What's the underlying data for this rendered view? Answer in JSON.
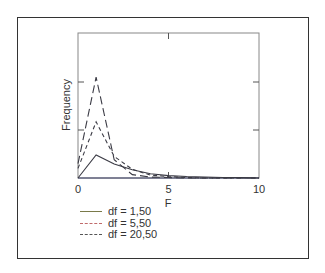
{
  "chart_data": {
    "type": "line",
    "title": "",
    "xlabel": "F",
    "ylabel": "Frequency",
    "xlim": [
      0,
      10
    ],
    "ylim": [
      0,
      3
    ],
    "xticks": [
      0,
      5,
      10
    ],
    "yticks_unlabeled": [
      1,
      2
    ],
    "grid": false,
    "legend_position": "below-left",
    "x": [
      0,
      1,
      2,
      3,
      4,
      5,
      6,
      7,
      8,
      9,
      10
    ],
    "series": [
      {
        "name": "df = 1,50",
        "style": "solid",
        "color": "#7a7a4a",
        "values": [
          0,
          0.48,
          0.29,
          0.17,
          0.09,
          0.05,
          0.03,
          0.02,
          0.01,
          0.01,
          0.0
        ]
      },
      {
        "name": "df = 5,50",
        "style": "dashed",
        "color": "#c06a6a",
        "values": [
          0.2,
          1.17,
          0.45,
          0.18,
          0.06,
          0.03,
          0.01,
          0.0,
          0.0,
          0.0,
          0.0
        ]
      },
      {
        "name": "df = 20,50",
        "style": "long-dashed",
        "color": "#555555",
        "values": [
          0.3,
          2.1,
          0.38,
          0.07,
          0.02,
          0.01,
          0.0,
          0.0,
          0.0,
          0.0,
          0.0
        ]
      }
    ]
  },
  "axes": {
    "xlabel": "F",
    "ylabel": "Frequency",
    "xtick_labels": [
      "0",
      "5",
      "10"
    ]
  },
  "legend": {
    "items": [
      {
        "label": "df = 1,50",
        "color": "#7a7a4a",
        "dash": "none"
      },
      {
        "label": "df = 5,50",
        "color": "#c06a6a",
        "dash": "3,2"
      },
      {
        "label": "df = 20,50",
        "color": "#555555",
        "dash": "7,3"
      }
    ]
  }
}
